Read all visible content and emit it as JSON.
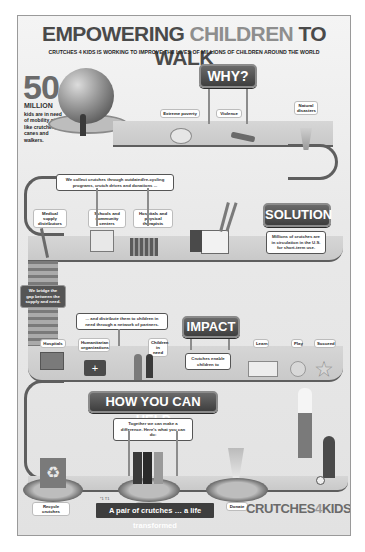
{
  "title": {
    "part1": "EMPOWERING ",
    "part2": "CHILDREN",
    "part3": " TO WALK"
  },
  "subtitle": "CRUTCHES 4 KIDS IS WORKING TO IMPROVE THE LIVES OF MILLIONS OF CHILDREN AROUND THE WORLD",
  "stat": {
    "number": "50",
    "unit": "MILLION",
    "description": "kids are in need of mobility aids like crutches, canes and walkers."
  },
  "why": {
    "heading": "WHY?",
    "reasons": [
      {
        "label": "Extreme poverty",
        "icon": "piggy-bank-icon"
      },
      {
        "label": "Violence",
        "icon": "gun-icon"
      },
      {
        "label": "Natural disasters",
        "icon": "tornado-icon"
      }
    ]
  },
  "solution": {
    "heading": "SOLUTION",
    "collect_text": "We collect crutches through outdated/re-cycling programs, crutch drives and donations ...",
    "sources": [
      {
        "label": "Medical supply distributors",
        "icon": "crutch-icon"
      },
      {
        "label": "Schools and community centers",
        "icon": "school-icon"
      },
      {
        "label": "Hospitals and physical therapists",
        "icon": "hospital-building-icon"
      }
    ],
    "fact": "Millions of crutches are in circulation in the U.S. for short-term use.",
    "bridge_text": "We bridge the gap between the supply and need."
  },
  "impact": {
    "heading": "IMPACT",
    "distribute_text": "... and distribute them to children in need through a network of partners.",
    "partners": [
      {
        "label": "Hospitals",
        "icon": "hospital-icon"
      },
      {
        "label": "Humanitarian organizations",
        "icon": "first-aid-kit-icon"
      },
      {
        "label": "Children in need",
        "icon": "children-icon"
      }
    ],
    "enable_text": "Crutches enable children to",
    "outcomes": [
      {
        "label": "Learn",
        "icon": "book-icon"
      },
      {
        "label": "Play",
        "icon": "ball-icon"
      },
      {
        "label": "Succeed",
        "icon": "star-icon"
      }
    ]
  },
  "help": {
    "heading": "HOW YOU CAN HELP",
    "intro": "Together we can make a difference. Here's what you can do:",
    "actions": [
      {
        "label": "Recycle crutches",
        "icon": "recycle-bin-icon"
      },
      {
        "label": "Volunteer",
        "icon": "volunteers-icon"
      },
      {
        "label": "Donate",
        "icon": "money-icon"
      }
    ]
  },
  "footer": {
    "footnote": "*1 T1",
    "tagline": "A pair of crutches … a life transformed",
    "logo_part1": "CRUTCHES",
    "logo_part2": "4",
    "logo_part3": "KIDS"
  }
}
